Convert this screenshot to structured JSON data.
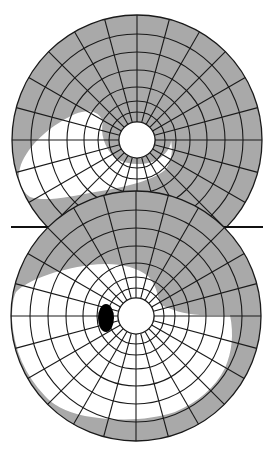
{
  "figure": {
    "colors": {
      "background": "#ffffff",
      "field_loss": "#a9a9a9",
      "preserved_field": "#ffffff",
      "grid": "#1a1a1a",
      "blind_spot": "#000000"
    },
    "grid": {
      "ring_radii": [
        18,
        28,
        39,
        53,
        70,
        88,
        106,
        125
      ],
      "spoke_count": 24,
      "inner_radius": 18
    },
    "separator": {
      "x1": 11,
      "x2": 263,
      "y": 227
    }
  },
  "charts": [
    {
      "id": "upper-field",
      "label": "Upper visual field chart",
      "center": [
        137,
        140
      ],
      "radius": 125,
      "preserved_region_path": "M 20 168 C 25 150 45 128 75 114 C 90 108 100 112 103 122 C 100 132 104 148 115 158 C 128 166 148 166 160 158 C 168 152 171 146 171 140 C 173 150 172 162 165 170 C 150 182 120 188 95 192 C 70 197 45 202 30 197 C 20 190 17 178 20 168 Z",
      "blind_spot": null
    },
    {
      "id": "lower-field",
      "label": "Lower visual field chart",
      "center": [
        136,
        316
      ],
      "radius": 125,
      "preserved_region_path": "M 16 292 C 28 280 55 270 90 265 C 115 262 135 266 148 276 C 156 284 158 296 160 304 C 170 310 185 314 200 315 L 230 315 C 234 335 232 352 225 368 C 215 388 198 402 175 412 C 150 420 120 422 85 416 C 65 412 52 404 45 396 C 25 375 14 350 12 320 C 12 308 13 298 16 292 Z",
      "blind_spot": {
        "cx": 106,
        "cy": 318,
        "rx": 8,
        "ry": 14
      }
    }
  ]
}
